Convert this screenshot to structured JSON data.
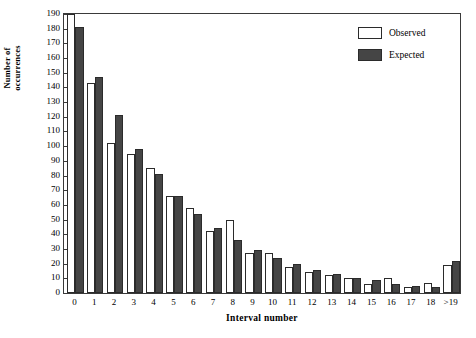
{
  "chart_data": {
    "type": "bar",
    "title": "",
    "xlabel": "Interval number",
    "ylabel": "Number of occurrences",
    "ylabel_line1": "Number of",
    "ylabel_line2": "occurrences",
    "categories": [
      "0",
      "1",
      "2",
      "3",
      "4",
      "5",
      "6",
      "7",
      "8",
      "9",
      "10",
      "11",
      "12",
      "13",
      "14",
      "15",
      "16",
      "17",
      "18",
      ">19"
    ],
    "series": [
      {
        "name": "Observed",
        "color": "#ffffff",
        "values": [
          190,
          143,
          102,
          95,
          85,
          66,
          58,
          42,
          50,
          27,
          27,
          18,
          14,
          12,
          10,
          6,
          10,
          4,
          7,
          19
        ]
      },
      {
        "name": "Expected",
        "color": "#454545",
        "values": [
          181,
          147,
          121,
          98,
          81,
          66,
          54,
          44,
          36,
          29,
          24,
          20,
          16,
          13,
          10,
          9,
          6,
          5,
          4,
          22
        ]
      }
    ],
    "ylim": [
      0,
      190
    ],
    "ytick_step": 10,
    "yticks": [
      0,
      10,
      20,
      30,
      40,
      50,
      60,
      70,
      80,
      90,
      100,
      110,
      120,
      130,
      140,
      150,
      160,
      170,
      180,
      190
    ],
    "grid": false,
    "legend_position": "top-right",
    "frame": true
  },
  "legend": {
    "items": [
      {
        "label": "Observed"
      },
      {
        "label": "Expected"
      }
    ]
  }
}
